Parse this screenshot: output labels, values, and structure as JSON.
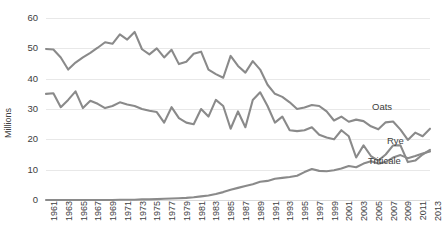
{
  "chart_data": {
    "type": "line",
    "title": "",
    "xlabel": "",
    "ylabel": "Millions",
    "ylim": [
      0,
      60
    ],
    "yticks": [
      0,
      10,
      20,
      30,
      40,
      50,
      60
    ],
    "grid": true,
    "legend_position": "inline-right",
    "x": [
      1961,
      1962,
      1963,
      1964,
      1965,
      1966,
      1967,
      1968,
      1969,
      1970,
      1971,
      1972,
      1973,
      1974,
      1975,
      1976,
      1977,
      1978,
      1979,
      1980,
      1981,
      1982,
      1983,
      1984,
      1985,
      1986,
      1987,
      1988,
      1989,
      1990,
      1991,
      1992,
      1993,
      1994,
      1995,
      1996,
      1997,
      1998,
      1999,
      2000,
      2001,
      2002,
      2003,
      2004,
      2005,
      2006,
      2007,
      2008,
      2009,
      2010,
      2011,
      2012,
      2013
    ],
    "xtick_labels": [
      "1961",
      "1963",
      "1965",
      "1967",
      "1969",
      "1971",
      "1973",
      "1975",
      "1977",
      "1979",
      "1981",
      "1983",
      "1985",
      "1987",
      "1989",
      "1991",
      "1993",
      "1995",
      "1997",
      "1999",
      "2001",
      "2003",
      "2005",
      "2007",
      "2009",
      "2011",
      "2013"
    ],
    "series": [
      {
        "name": "Oats",
        "color": "#8a8a8a",
        "values": [
          49.8,
          49.6,
          47.0,
          43.0,
          45.3,
          47.0,
          48.5,
          50.2,
          52.0,
          51.5,
          54.6,
          52.9,
          55.4,
          49.7,
          48.0,
          50.0,
          47.0,
          49.5,
          44.8,
          45.6,
          48.2,
          48.9,
          43.0,
          41.5,
          40.3,
          47.5,
          44.2,
          42.0,
          45.8,
          43.0,
          38.0,
          35.0,
          34.0,
          32.2,
          30.0,
          30.5,
          31.3,
          31.0,
          29.2,
          26.2,
          27.5,
          25.8,
          26.5,
          26.0,
          24.3,
          23.3,
          25.6,
          25.9,
          23.2,
          19.8,
          22.2,
          21.0,
          23.5
        ]
      },
      {
        "name": "Rye",
        "color": "#8a8a8a",
        "values": [
          35.0,
          35.2,
          30.6,
          33.0,
          35.8,
          30.3,
          32.7,
          31.7,
          30.3,
          31.0,
          32.2,
          31.5,
          31.0,
          30.0,
          29.4,
          29.0,
          25.5,
          30.6,
          27.0,
          25.5,
          25.0,
          30.0,
          27.5,
          33.0,
          31.0,
          23.5,
          29.2,
          24.0,
          33.0,
          35.5,
          31.0,
          25.5,
          27.5,
          23.0,
          22.7,
          23.0,
          24.0,
          21.5,
          20.6,
          20.0,
          23.0,
          21.0,
          14.0,
          18.0,
          14.5,
          13.0,
          15.0,
          18.0,
          18.0,
          12.5,
          13.0,
          15.0,
          16.5
        ]
      },
      {
        "name": "Triticale",
        "color": "#8a8a8a",
        "values": [
          0.0,
          0.0,
          0.0,
          0.0,
          0.0,
          0.0,
          0.0,
          0.0,
          0.0,
          0.0,
          0.1,
          0.1,
          0.1,
          0.2,
          0.2,
          0.3,
          0.4,
          0.5,
          0.6,
          0.7,
          0.9,
          1.2,
          1.5,
          2.0,
          2.6,
          3.4,
          4.0,
          4.6,
          5.2,
          6.0,
          6.3,
          7.0,
          7.3,
          7.6,
          8.0,
          9.2,
          10.2,
          9.6,
          9.5,
          9.8,
          10.4,
          11.2,
          10.8,
          12.0,
          12.8,
          12.0,
          12.5,
          14.0,
          14.8,
          13.8,
          14.5,
          15.3,
          16.0
        ]
      }
    ]
  },
  "labels": {
    "axis_y_title": "Millions",
    "series_oats": "Oats",
    "series_rye": "Rye",
    "series_triticale": "Triticale"
  }
}
